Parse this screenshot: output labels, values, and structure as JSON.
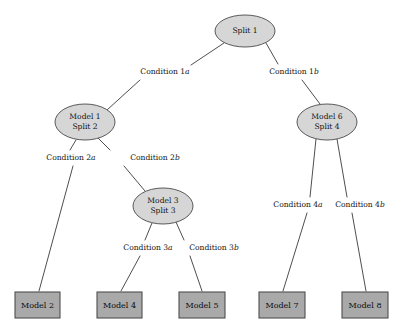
{
  "figure": {
    "type": "decision-tree-diagram",
    "width": 398,
    "height": 330,
    "background_color": "#ffffff",
    "split_node_fill": "#d6d6d6",
    "split_node_stroke": "#4a4a4a",
    "leaf_node_fill": "#a9a9a9",
    "leaf_node_stroke": "#4f4f4f",
    "edge_color": "#3a3a3a",
    "text_color": "#141414"
  },
  "nodes": {
    "split1": {
      "line1": "Split 1",
      "line2": "",
      "cx": 245,
      "cy": 31,
      "rx": 30,
      "ry": 16
    },
    "model1split2": {
      "line1": "Model 1",
      "line2": "Split 2",
      "cx": 85,
      "cy": 122,
      "rx": 30,
      "ry": 18
    },
    "model3split3": {
      "line1": "Model 3",
      "line2": "Split 3",
      "cx": 163,
      "cy": 206,
      "rx": 30,
      "ry": 18
    },
    "model6split4": {
      "line1": "Model 6",
      "line2": "Split 4",
      "cx": 327,
      "cy": 122,
      "rx": 30,
      "ry": 18
    }
  },
  "leaves": {
    "model2": {
      "label": "Model 2",
      "x": 15,
      "y": 292,
      "w": 45,
      "h": 26
    },
    "model4": {
      "label": "Model 4",
      "x": 97,
      "y": 292,
      "w": 45,
      "h": 26
    },
    "model5": {
      "label": "Model 5",
      "x": 179,
      "y": 292,
      "w": 46,
      "h": 26
    },
    "model7": {
      "label": "Model 7",
      "x": 259,
      "y": 292,
      "w": 46,
      "h": 26
    },
    "model8": {
      "label": "Model 8",
      "x": 342,
      "y": 292,
      "w": 46,
      "h": 26
    }
  },
  "edge_labels": {
    "c1a": {
      "prefix": "Condition 1",
      "suffix": "a",
      "x": 165,
      "y": 72
    },
    "c1b": {
      "prefix": "Condition 1",
      "suffix": "b",
      "x": 294,
      "y": 72
    },
    "c2a": {
      "prefix": "Condition 2",
      "suffix": "a",
      "x": 71,
      "y": 158
    },
    "c2b": {
      "prefix": "Condition 2",
      "suffix": "b",
      "x": 155,
      "y": 158
    },
    "c3a": {
      "prefix": "Condition 3",
      "suffix": "a",
      "x": 148,
      "y": 248
    },
    "c3b": {
      "prefix": "Condition 3",
      "suffix": "b",
      "x": 214,
      "y": 248
    },
    "c4a": {
      "prefix": "Condition 4",
      "suffix": "a",
      "x": 298,
      "y": 205
    },
    "c4b": {
      "prefix": "Condition 4",
      "suffix": "b",
      "x": 360,
      "y": 205
    }
  },
  "edges": [
    {
      "name": "split1-to-model1",
      "from": "split1",
      "to": "model1split2",
      "label": "c1a",
      "seg1": "M 224,43 L 191,65",
      "seg2": "M 140,80 L 107,110"
    },
    {
      "name": "split1-to-model6",
      "from": "split1",
      "to": "model6split4",
      "label": "c1b",
      "seg1": "M 266,43 L 278,64",
      "seg2": "M 302,80 L 320,104"
    },
    {
      "name": "model1-to-model2",
      "from": "model1split2",
      "to": "model2",
      "label": "c2a",
      "seg1": "M 76,140 L 70,150",
      "seg2": "M 73,166 L 39,291"
    },
    {
      "name": "model1-to-model3",
      "from": "model1split2",
      "to": "model3split3",
      "label": "c2b",
      "seg1": "M 98,138 L 110,150",
      "seg2": "M 124,166 L 145,191"
    },
    {
      "name": "model3-to-model4",
      "from": "model3split3",
      "to": "model4",
      "label": "c3a",
      "seg1": "M 152,223 L 145,240",
      "seg2": "M 140,256 L 121,291"
    },
    {
      "name": "model3-to-model5",
      "from": "model3split3",
      "to": "model5",
      "label": "c3b",
      "seg1": "M 176,222 L 184,240",
      "seg2": "M 190,256 L 202,291"
    },
    {
      "name": "model6-to-model7",
      "from": "model6split4",
      "to": "model7",
      "label": "c4a",
      "seg1": "M 316,139 L 310,197",
      "seg2": "M 307,213 L 283,291"
    },
    {
      "name": "model6-to-model8",
      "from": "model6split4",
      "to": "model8",
      "label": "c4b",
      "seg1": "M 337,139 L 347,197",
      "seg2": "M 352,213 L 366,291"
    }
  ]
}
